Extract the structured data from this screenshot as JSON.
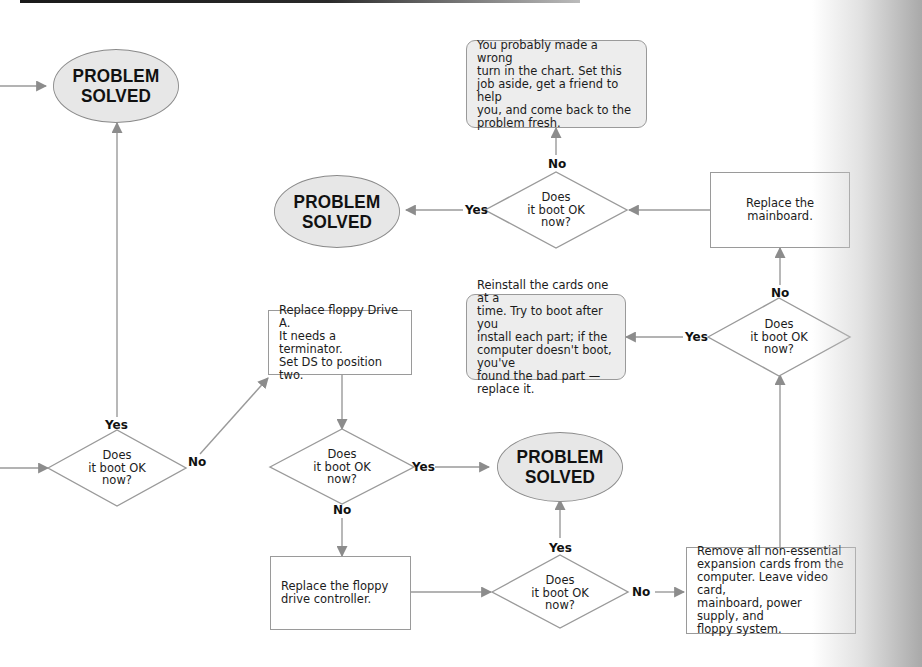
{
  "diagram": {
    "type": "flowchart",
    "colors": {
      "line": "#9a9a9a",
      "arrowhead": "#8c8c8c",
      "oval_fill": "#e7e7e7",
      "note_fill": "#ededed",
      "text": "#1c1c1c"
    },
    "nodes": {
      "oval_top_left": "PROBLEM\nSOLVED",
      "oval_mid_left": "PROBLEM\nSOLVED",
      "oval_center": "PROBLEM\nSOLVED",
      "note_wrong_turn": "You probably made a wrong\nturn in the chart.  Set this\njob aside, get a friend to help\nyou, and come back to the\nproblem fresh.",
      "box_mainboard": "Replace the\nmainboard.",
      "note_reinstall": "Reinstall the cards one at a\ntime.  Try to boot after you\ninstall each part; if the\ncomputer doesn't boot, you've\nfound the bad part — replace it.",
      "box_floppy_a": "Replace floppy Drive A.\nIt needs a terminator.\nSet DS to position two.",
      "box_controller": "Replace the floppy\ndrive controller.",
      "box_remove_cards": "Remove all non-essential\nexpansion cards from the\ncomputer.  Leave video card,\nmainboard, power supply, and\nfloppy system.",
      "diamond_left": "Does\nit boot OK\nnow?",
      "diamond_top": "Does\nit boot OK\nnow?",
      "diamond_right": "Does\nit boot OK\nnow?",
      "diamond_mid": "Does\nit boot OK\nnow?",
      "diamond_bottom": "Does\nit boot OK\nnow?"
    },
    "labels": {
      "left_yes": "Yes",
      "left_no": "No",
      "top_yes": "Yes",
      "top_no": "No",
      "right_yes": "Yes",
      "right_no": "No",
      "mid_yes": "Yes",
      "mid_no": "No",
      "bottom_yes": "Yes",
      "bottom_no": "No"
    }
  }
}
